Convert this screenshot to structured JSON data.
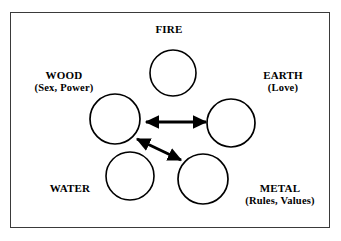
{
  "figure": {
    "type": "five-element-relationship-diagram",
    "width": 341,
    "height": 241,
    "background_color": "#ffffff",
    "frame": {
      "border_color": "#3a3a3a",
      "border_width": 1.5,
      "x": 10,
      "y": 12,
      "width": 320,
      "height": 216
    },
    "circle_style": {
      "stroke_color": "#000000",
      "stroke_width": 1.6,
      "fill_color": "#ffffff"
    },
    "arrow_style": {
      "color": "#000000",
      "stroke_width": 3
    }
  },
  "nodes": [
    {
      "id": "fire",
      "name": "FIRE",
      "sub": "",
      "circle": {
        "cx": 173,
        "cy": 73,
        "r": 23
      }
    },
    {
      "id": "wood",
      "name": "WOOD",
      "sub": "(Sex, Power)",
      "circle": {
        "cx": 115,
        "cy": 119,
        "r": 25
      }
    },
    {
      "id": "earth",
      "name": "EARTH",
      "sub": "(Love)",
      "circle": {
        "cx": 231,
        "cy": 123,
        "r": 24
      }
    },
    {
      "id": "water",
      "name": "WATER",
      "sub": "",
      "circle": {
        "cx": 130,
        "cy": 176,
        "r": 24
      }
    },
    {
      "id": "metal",
      "name": "METAL",
      "sub": "(Rules, Values)",
      "circle": {
        "cx": 203,
        "cy": 179,
        "r": 25
      }
    }
  ],
  "arrows": [
    {
      "id": "wood-earth",
      "from": "wood",
      "to": "earth",
      "double_headed": true,
      "x1": 146,
      "y1": 122,
      "x2": 206,
      "y2": 122
    },
    {
      "id": "wood-metal",
      "from": "metal",
      "to": "wood",
      "double_headed": true,
      "x1": 137,
      "y1": 139,
      "x2": 181,
      "y2": 160
    }
  ]
}
